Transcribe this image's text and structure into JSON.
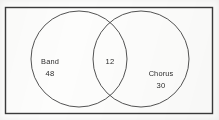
{
  "figure": {
    "type": "venn-diagram",
    "background_color": "#fdfdfc",
    "stroke_color": "#3a3a3a",
    "text_color": "#2b2b2b"
  },
  "universe": {
    "name": "universal-set-rectangle",
    "x": 5,
    "y": 7,
    "width": 207,
    "height": 106
  },
  "chart_data": {
    "type": "venn",
    "title": "",
    "sets": [
      {
        "label": "Band",
        "value": "48",
        "only_count": 48
      },
      {
        "label": "Chorus",
        "value": "30",
        "only_count": 30
      }
    ],
    "intersection": {
      "label": "",
      "value": "12",
      "count": 12
    },
    "categories": [
      "Band only",
      "Both",
      "Chorus only"
    ],
    "values": [
      48,
      12,
      30
    ],
    "xlabel": "",
    "ylabel": "",
    "legend": "none",
    "grid": false
  },
  "circles": {
    "left": {
      "name": "band-circle",
      "cx": 79,
      "cy": 59,
      "r": 48
    },
    "right": {
      "name": "chorus-circle",
      "cx": 141,
      "cy": 59,
      "r": 48
    }
  },
  "labels": {
    "left_name": {
      "text": "Band",
      "x": 50,
      "y": 62
    },
    "left_value": {
      "text": "48",
      "x": 50,
      "y": 74
    },
    "center_value": {
      "text": "12",
      "x": 110,
      "y": 62
    },
    "right_name": {
      "text": "Chorus",
      "x": 161,
      "y": 74
    },
    "right_value": {
      "text": "30",
      "x": 161,
      "y": 86
    }
  }
}
